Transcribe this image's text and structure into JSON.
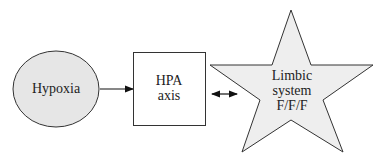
{
  "diagram": {
    "nodes": {
      "hypoxia": {
        "label": "Hypoxia",
        "shape": "ellipse",
        "fill": "#e6e6e6"
      },
      "hpa": {
        "line1": "HPA",
        "line2": "axis",
        "shape": "rectangle",
        "fill": "#ffffff"
      },
      "limbic": {
        "line1": "Limbic",
        "line2": "system",
        "line3": "F/F/F",
        "shape": "star",
        "fill": "#eeeeee"
      }
    },
    "edges": [
      {
        "from": "Hypoxia",
        "to": "HPA axis",
        "type": "single-arrow"
      },
      {
        "from": "HPA axis",
        "to": "Limbic system F/F/F",
        "type": "double-arrow"
      }
    ]
  }
}
